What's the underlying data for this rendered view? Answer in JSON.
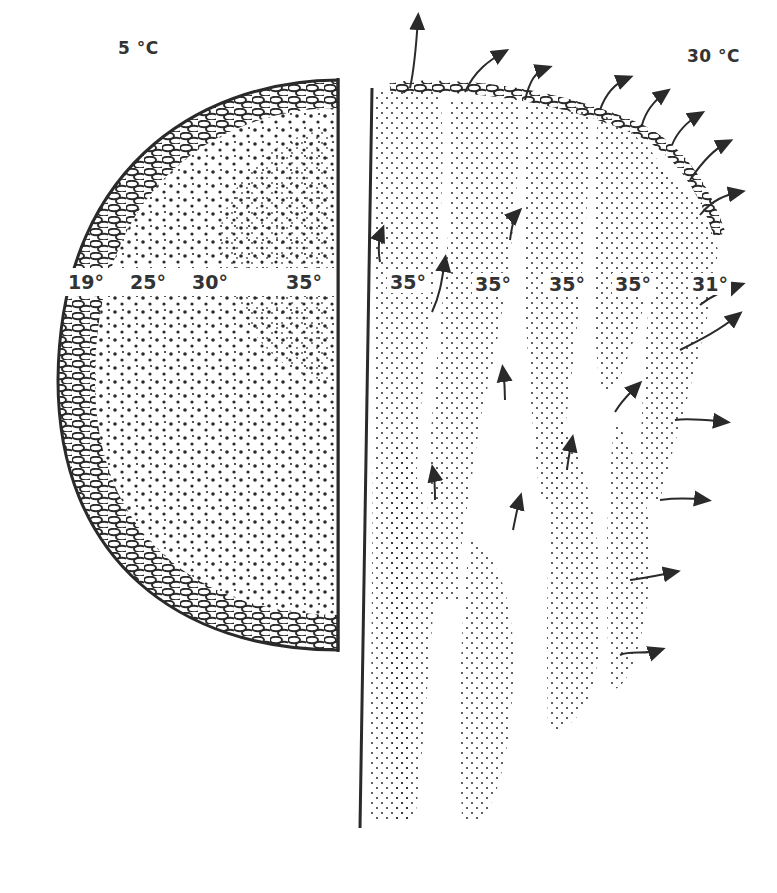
{
  "panels": {
    "left": {
      "title": "5 °C",
      "zone_temperatures": [
        {
          "label": "19°",
          "x": 86,
          "y": 282
        },
        {
          "label": "25°",
          "x": 148,
          "y": 282
        },
        {
          "label": "30°",
          "x": 210,
          "y": 282
        },
        {
          "label": "35°",
          "x": 304,
          "y": 282
        }
      ]
    },
    "right": {
      "title": "30 °C",
      "zone_temperatures": [
        {
          "label": "35°",
          "x": 408,
          "y": 282
        },
        {
          "label": "35°",
          "x": 493,
          "y": 284
        },
        {
          "label": "35°",
          "x": 567,
          "y": 284
        },
        {
          "label": "35°",
          "x": 633,
          "y": 284
        },
        {
          "label": "31°",
          "x": 710,
          "y": 284
        }
      ]
    }
  },
  "colors": {
    "ink": "#2a2a2a",
    "background": "#ffffff"
  }
}
